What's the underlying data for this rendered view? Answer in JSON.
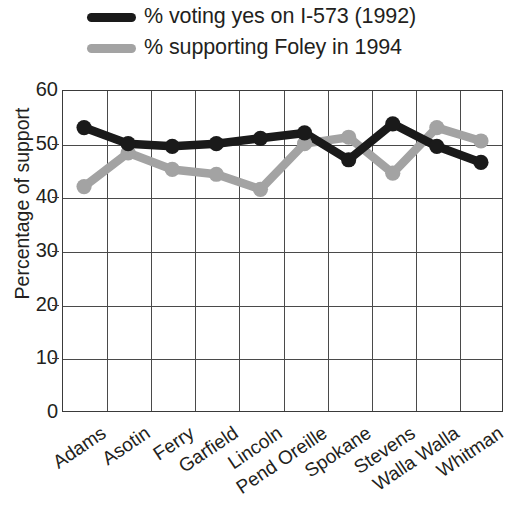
{
  "chart_data": {
    "type": "line",
    "title": "",
    "subtitle": "",
    "xlabel": "",
    "ylabel": "Percentage of support",
    "ylim": [
      0,
      60
    ],
    "yticks": [
      0,
      10,
      20,
      30,
      40,
      50,
      60
    ],
    "grid": true,
    "legend_position": "above-plot-left",
    "categories": [
      "Adams",
      "Asotin",
      "Ferry",
      "Garfield",
      "Lincoln",
      "Pend Oreille",
      "Spokane",
      "Stevens",
      "Walla Walla",
      "Whitman"
    ],
    "series": [
      {
        "name": "% voting yes on I-573 (1992)",
        "color": "#1a1a1a",
        "marker": "circle",
        "values": [
          53.0,
          50.0,
          49.5,
          50.0,
          51.0,
          52.0,
          47.0,
          53.7,
          49.5,
          46.5
        ]
      },
      {
        "name": "% supporting Foley in 1994",
        "color": "#a3a3a3",
        "marker": "circle",
        "values": [
          42.0,
          48.3,
          45.2,
          44.3,
          41.5,
          50.0,
          51.2,
          44.5,
          53.0,
          50.5
        ]
      }
    ]
  },
  "legend": {
    "items": [
      {
        "label": "% voting yes on I-573 (1992)",
        "color": "#1a1a1a"
      },
      {
        "label": "% supporting Foley in 1994",
        "color": "#a3a3a3"
      }
    ]
  },
  "axes": {
    "y_title": "Percentage of support",
    "y_ticks": [
      "60",
      "50",
      "40",
      "30",
      "20",
      "10",
      "0"
    ],
    "x_ticks": [
      "Adams",
      "Asotin",
      "Ferry",
      "Garfield",
      "Lincoln",
      "Pend Oreille",
      "Spokane",
      "Stevens",
      "Walla Walla",
      "Whitman"
    ]
  }
}
